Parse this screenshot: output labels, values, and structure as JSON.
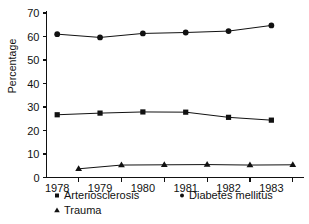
{
  "chart_data": {
    "type": "line",
    "title": "",
    "xlabel": "",
    "ylabel": "Percentage",
    "x": [
      1978,
      1979,
      1980,
      1981,
      1982,
      1983
    ],
    "xtick_labels": [
      "1978",
      "1979",
      "1980",
      "1981",
      "1982",
      "1983"
    ],
    "ytick_labels": [
      "0",
      "10",
      "20",
      "30",
      "40",
      "50",
      "60",
      "70"
    ],
    "yticks": [
      0,
      10,
      20,
      30,
      40,
      50,
      60,
      70
    ],
    "ylim": [
      0,
      70
    ],
    "xlim": [
      1977.75,
      1983.75
    ],
    "grid": false,
    "legend_position": "bottom",
    "series": [
      {
        "name": "Diabetes mellitus",
        "marker": "dot",
        "values": [
          61.0,
          59.6,
          61.3,
          61.7,
          62.3,
          64.7
        ],
        "x": [
          1978,
          1979,
          1980,
          1981,
          1982,
          1983
        ]
      },
      {
        "name": "Arteriosclerosis",
        "marker": "square",
        "values": [
          26.7,
          27.4,
          27.9,
          27.8,
          25.6,
          24.4
        ],
        "x": [
          1978,
          1979,
          1980,
          1981,
          1982,
          1983
        ]
      },
      {
        "name": "Trauma",
        "marker": "triangle",
        "values": [
          3.7,
          5.3,
          5.4,
          5.5,
          5.3,
          5.4
        ],
        "x": [
          1978.5,
          1979.5,
          1980.5,
          1981.5,
          1982.5,
          1983.5
        ]
      }
    ],
    "legend": [
      {
        "label": "Arteriosclerosis",
        "marker": "square"
      },
      {
        "label": "Diabetes mellitus",
        "marker": "dot"
      },
      {
        "label": "Trauma",
        "marker": "triangle"
      }
    ]
  }
}
